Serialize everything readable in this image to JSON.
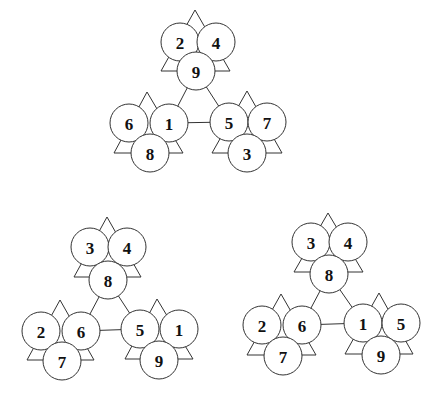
{
  "diagrams": [
    {
      "name": "top",
      "outer_edges": [
        [
          0,
          2
        ],
        [
          0,
          1
        ],
        [
          1,
          2
        ]
      ],
      "clusters": [
        {
          "triangle": [
            [
              195,
              10
            ],
            [
              161,
              71
            ],
            [
              230,
              71
            ]
          ],
          "nodes": [
            {
              "x": 180,
              "y": 42,
              "label": "2"
            },
            {
              "x": 216,
              "y": 42,
              "label": "4"
            },
            {
              "x": 196,
              "y": 71,
              "label": "9"
            }
          ],
          "hub": 2
        },
        {
          "triangle": [
            [
              147,
              92
            ],
            [
              114,
              153
            ],
            [
              183,
              153
            ]
          ],
          "nodes": [
            {
              "x": 129,
              "y": 123,
              "label": "6"
            },
            {
              "x": 169,
              "y": 123,
              "label": "1"
            },
            {
              "x": 150,
              "y": 153,
              "label": "8"
            }
          ],
          "hub": 1
        },
        {
          "triangle": [
            [
              247,
              91
            ],
            [
              212,
              153
            ],
            [
              282,
              153
            ]
          ],
          "nodes": [
            {
              "x": 229,
              "y": 122,
              "label": "5"
            },
            {
              "x": 267,
              "y": 122,
              "label": "7"
            },
            {
              "x": 247,
              "y": 153,
              "label": "3"
            }
          ],
          "hub": 0
        }
      ]
    },
    {
      "name": "bottom-left",
      "clusters": [
        {
          "triangle": [
            [
              107,
              217
            ],
            [
              74,
              277
            ],
            [
              141,
              277
            ]
          ],
          "nodes": [
            {
              "x": 90,
              "y": 247,
              "label": "3"
            },
            {
              "x": 127,
              "y": 247,
              "label": "4"
            },
            {
              "x": 108,
              "y": 280,
              "label": "8"
            }
          ],
          "hub": 2
        },
        {
          "triangle": [
            [
              60,
              300
            ],
            [
              27,
              360
            ],
            [
              94,
              360
            ]
          ],
          "nodes": [
            {
              "x": 41,
              "y": 331,
              "label": "2"
            },
            {
              "x": 81,
              "y": 331,
              "label": "6"
            },
            {
              "x": 62,
              "y": 361,
              "label": "7"
            }
          ],
          "hub": 1
        },
        {
          "triangle": [
            [
              157,
              299
            ],
            [
              125,
              359
            ],
            [
              193,
              359
            ]
          ],
          "nodes": [
            {
              "x": 140,
              "y": 329,
              "label": "5"
            },
            {
              "x": 179,
              "y": 329,
              "label": "1"
            },
            {
              "x": 159,
              "y": 360,
              "label": "9"
            }
          ],
          "hub": 0
        }
      ]
    },
    {
      "name": "bottom-right",
      "clusters": [
        {
          "triangle": [
            [
              328,
              213
            ],
            [
              294,
              272
            ],
            [
              363,
              272
            ]
          ],
          "nodes": [
            {
              "x": 311,
              "y": 242,
              "label": "3"
            },
            {
              "x": 348,
              "y": 242,
              "label": "4"
            },
            {
              "x": 329,
              "y": 274,
              "label": "8"
            }
          ],
          "hub": 2
        },
        {
          "triangle": [
            [
              281,
              294
            ],
            [
              247,
              355
            ],
            [
              316,
              355
            ]
          ],
          "nodes": [
            {
              "x": 262,
              "y": 325,
              "label": "2"
            },
            {
              "x": 302,
              "y": 325,
              "label": "6"
            },
            {
              "x": 283,
              "y": 356,
              "label": "7"
            }
          ],
          "hub": 1
        },
        {
          "triangle": [
            [
              379,
              293
            ],
            [
              345,
              354
            ],
            [
              413,
              354
            ]
          ],
          "nodes": [
            {
              "x": 363,
              "y": 323,
              "label": "1"
            },
            {
              "x": 401,
              "y": 323,
              "label": "5"
            },
            {
              "x": 381,
              "y": 355,
              "label": "9"
            }
          ],
          "hub": 0
        }
      ]
    }
  ],
  "style": {
    "node_radius": 19,
    "stroke_color": "#333333",
    "background": "#ffffff"
  }
}
